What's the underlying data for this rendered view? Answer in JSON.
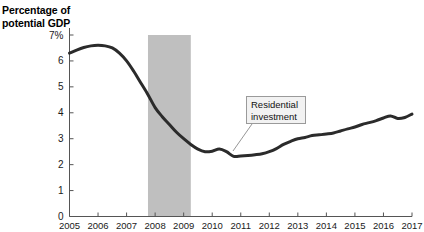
{
  "chart_data": {
    "type": "line",
    "title": "Percentage of\npotential GDP",
    "xlabel": "",
    "ylabel": "Percentage of potential GDP",
    "ylim": [
      0,
      7
    ],
    "xlim": [
      2005,
      2017
    ],
    "grid": false,
    "legend": "none",
    "ytick_labels": [
      "0",
      "1",
      "2",
      "3",
      "4",
      "5",
      "6",
      "7%"
    ],
    "ytick_values": [
      0,
      1,
      2,
      3,
      4,
      5,
      6,
      7
    ],
    "xtick_labels": [
      "2005",
      "2006",
      "2007",
      "2008",
      "2009",
      "2010",
      "2011",
      "2012",
      "2013",
      "2014",
      "2015",
      "2016",
      "2017"
    ],
    "xtick_values": [
      2005,
      2006,
      2007,
      2008,
      2009,
      2010,
      2011,
      2012,
      2013,
      2014,
      2015,
      2016,
      2017
    ],
    "series": [
      {
        "name": "Residential investment",
        "color": "#2b2b2b",
        "x": [
          2005.0,
          2005.25,
          2005.5,
          2005.75,
          2006.0,
          2006.25,
          2006.5,
          2006.75,
          2007.0,
          2007.25,
          2007.5,
          2007.75,
          2008.0,
          2008.25,
          2008.5,
          2008.75,
          2009.0,
          2009.25,
          2009.5,
          2009.75,
          2010.0,
          2010.25,
          2010.5,
          2010.75,
          2011.0,
          2011.25,
          2011.5,
          2011.75,
          2012.0,
          2012.25,
          2012.5,
          2012.75,
          2013.0,
          2013.25,
          2013.5,
          2013.75,
          2014.0,
          2014.25,
          2014.5,
          2014.75,
          2015.0,
          2015.25,
          2015.5,
          2015.75,
          2016.0,
          2016.25,
          2016.5,
          2016.75,
          2017.0
        ],
        "y": [
          6.3,
          6.42,
          6.52,
          6.58,
          6.6,
          6.58,
          6.5,
          6.3,
          6.0,
          5.6,
          5.15,
          4.7,
          4.2,
          3.85,
          3.55,
          3.25,
          3.0,
          2.78,
          2.6,
          2.5,
          2.52,
          2.6,
          2.5,
          2.32,
          2.33,
          2.35,
          2.38,
          2.42,
          2.5,
          2.62,
          2.78,
          2.9,
          3.0,
          3.05,
          3.12,
          3.15,
          3.18,
          3.22,
          3.3,
          3.38,
          3.45,
          3.55,
          3.62,
          3.7,
          3.8,
          3.88,
          3.78,
          3.82,
          3.95
        ]
      }
    ],
    "shaded_regions": [
      {
        "name": "recession-band",
        "x_start": 2007.75,
        "x_end": 2009.25,
        "color": "#bfbfbf"
      }
    ],
    "annotations": [
      {
        "name": "residential-investment-callout",
        "text": "Residential\ninvestment",
        "box_x": 246,
        "box_y": 96,
        "box_w": 60,
        "box_h": 28,
        "leader_from_x": 252,
        "leader_from_y": 124,
        "leader_to_x": 233,
        "leader_to_y": 151
      }
    ]
  }
}
